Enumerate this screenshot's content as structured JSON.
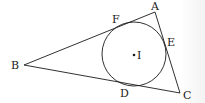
{
  "diagram": {
    "stroke_color": "#1a1a1a",
    "vertices": {
      "A": {
        "label": "A",
        "x": 155,
        "y": 12
      },
      "B": {
        "label": "B",
        "x": 24,
        "y": 65
      },
      "C": {
        "label": "C",
        "x": 180,
        "y": 93
      }
    },
    "incircle": {
      "cx": 134,
      "cy": 54,
      "r": 32
    },
    "center": {
      "label": "I"
    },
    "tangent_points": {
      "D": {
        "label": "D"
      },
      "E": {
        "label": "E"
      },
      "F": {
        "label": "F"
      }
    }
  }
}
